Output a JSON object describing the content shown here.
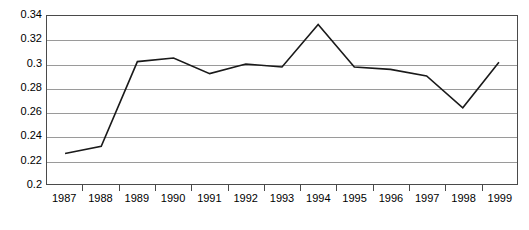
{
  "chart_data": {
    "type": "line",
    "title": "",
    "subtitle": "",
    "xlabel": "",
    "ylabel": "",
    "categories": [
      "1987",
      "1988",
      "1989",
      "1990",
      "1991",
      "1992",
      "1993",
      "1994",
      "1995",
      "1996",
      "1997",
      "1998",
      "1999"
    ],
    "series": [
      {
        "name": "",
        "values": [
          0.2255,
          0.2315,
          0.302,
          0.305,
          0.292,
          0.3,
          0.2975,
          0.333,
          0.2975,
          0.2955,
          0.29,
          0.2635,
          0.3015
        ]
      }
    ],
    "ylim": [
      0.2,
      0.34
    ],
    "yticks": [
      0.2,
      0.22,
      0.24,
      0.26,
      0.28,
      0.3,
      0.32,
      0.34
    ],
    "ytick_labels": [
      "0.2",
      "0.22",
      "0.24",
      "0.26",
      "0.28",
      "0.3",
      "0.32",
      "0.34"
    ],
    "grid": true,
    "grid_axis": "y",
    "legend": false,
    "legend_position": "none",
    "line_color": "#1a1a1a",
    "grid_color": "#9a9a9a",
    "frame_color": "#4a4a4a",
    "background_color": "#ffffff",
    "markers": false,
    "annotations": []
  }
}
